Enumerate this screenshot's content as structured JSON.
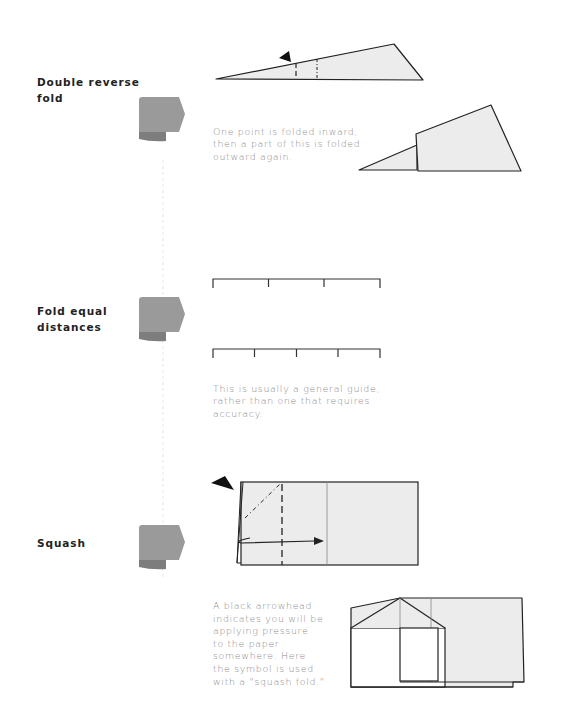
{
  "sections": [
    {
      "title": "Double reverse\nfold",
      "description": "One point is folded inward,\nthen a part of this is folded\noutward again.",
      "icon": "folded-tab-icon"
    },
    {
      "title": "Fold equal\ndistances",
      "description": "This is usually a general guide,\nrather than one that requires\naccuracy.",
      "icon": "folded-tab-icon"
    },
    {
      "title": "Squash",
      "description": "A black arrowhead\nindicates you will be\napplying pressure\nto the paper\nsomewhere. Here\nthe symbol is used\nwith a \"squash fold.\"",
      "icon": "folded-tab-icon"
    }
  ],
  "colors": {
    "paper_fill": "#ececec",
    "tab_gray": "#9a9a9a",
    "tab_shadow": "#7d7d7d",
    "line": "#222222",
    "body_text": "#8a8a8a"
  }
}
